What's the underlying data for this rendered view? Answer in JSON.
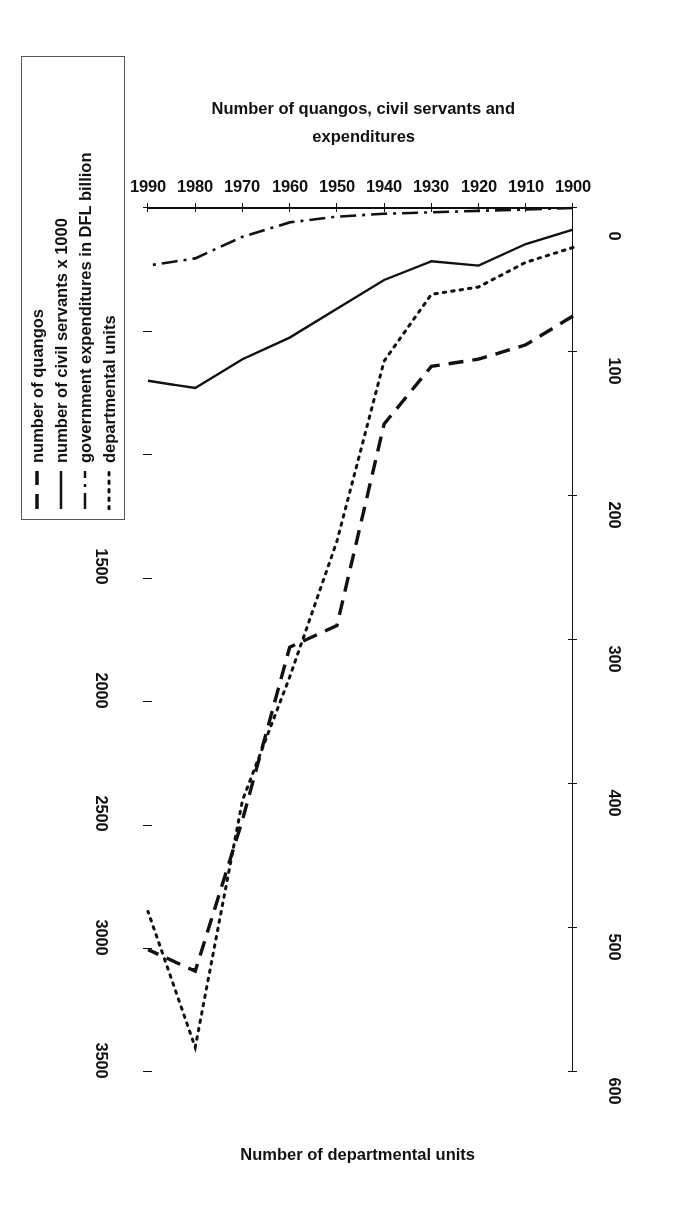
{
  "figure": {
    "orientation_note": "printed upside-down on the page",
    "left_axis_title": "Number of quangos, civil servants and expenditures",
    "right_axis_title": "Number of departmental units",
    "x_axis_title": ""
  },
  "axes": {
    "x_ticks": [
      "1900",
      "1910",
      "1920",
      "1930",
      "1940",
      "1950",
      "1960",
      "1970",
      "1980",
      "1990"
    ],
    "left_ticks": [
      "0",
      "100",
      "200",
      "300",
      "400",
      "500",
      "600"
    ],
    "right_ticks": [
      "0",
      "500",
      "1000",
      "1500",
      "2000",
      "2500",
      "3000",
      "3500"
    ]
  },
  "legend": {
    "items": [
      {
        "label": "number of quangos",
        "style": "dashed"
      },
      {
        "label": "number of civil servants x 1000",
        "style": "solid"
      },
      {
        "label": "government expenditures in DFL billion",
        "style": "dashdot"
      },
      {
        "label": "departmental units",
        "style": "dotted"
      }
    ]
  },
  "colors": {
    "ink": "#111111",
    "frame": "#555555",
    "background": "#ffffff"
  },
  "chart_data": {
    "type": "line",
    "title": "",
    "xlabel": "",
    "ylabel": "Number of quangos, civil servants and expenditures",
    "y2label": "Number of departmental units",
    "xlim": [
      1900,
      1990
    ],
    "ylim": [
      0,
      600
    ],
    "y2lim": [
      0,
      3500
    ],
    "grid": false,
    "legend_position": "outside-right",
    "x": [
      1900,
      1910,
      1920,
      1930,
      1940,
      1950,
      1960,
      1970,
      1980,
      1990
    ],
    "series": [
      {
        "name": "number of quangos",
        "axis": "left",
        "style": "dashed",
        "values": [
          75,
          95,
          105,
          110,
          150,
          290,
          305,
          425,
          530,
          515
        ]
      },
      {
        "name": "number of civil servants x 1000",
        "axis": "left",
        "style": "solid",
        "values": [
          15,
          25,
          40,
          37,
          50,
          70,
          90,
          105,
          125,
          120
        ]
      },
      {
        "name": "government expenditures in DFL billion",
        "axis": "left",
        "style": "dashdot",
        "values": [
          0,
          1,
          2,
          3,
          4,
          6,
          10,
          20,
          35,
          40
        ]
      },
      {
        "name": "departmental units",
        "axis": "right",
        "style": "dotted",
        "values": [
          160,
          220,
          320,
          350,
          620,
          1350,
          1900,
          2400,
          3400,
          2850
        ]
      }
    ]
  }
}
